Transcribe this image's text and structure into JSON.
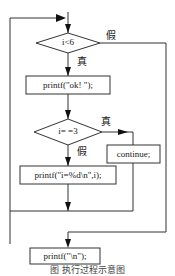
{
  "flowchart": {
    "nodes": [
      {
        "id": "cond1",
        "type": "decision",
        "text": "i<6"
      },
      {
        "id": "print_ok",
        "type": "process",
        "text": "printf(\"ok! \");"
      },
      {
        "id": "cond2",
        "type": "decision",
        "text": "i= =3"
      },
      {
        "id": "continue",
        "type": "process",
        "text": "continue;"
      },
      {
        "id": "print_i",
        "type": "process",
        "text": "printf(\"i=%d\\n\",i);"
      },
      {
        "id": "print_nl",
        "type": "process",
        "text": "printf(\"\\n\");"
      }
    ],
    "labels": {
      "cond1_false": "假",
      "cond1_true": "真",
      "cond2_true": "真",
      "cond2_false": "假"
    },
    "edges": [
      {
        "from": "cond1",
        "to": "print_ok",
        "label": "真"
      },
      {
        "from": "cond1",
        "to": "print_nl",
        "label": "假"
      },
      {
        "from": "print_ok",
        "to": "cond2"
      },
      {
        "from": "cond2",
        "to": "continue",
        "label": "真"
      },
      {
        "from": "cond2",
        "to": "print_i",
        "label": "假"
      },
      {
        "from": "continue",
        "to": "cond1"
      },
      {
        "from": "print_i",
        "to": "cond1"
      }
    ]
  },
  "caption": "图           执行过程示意图"
}
